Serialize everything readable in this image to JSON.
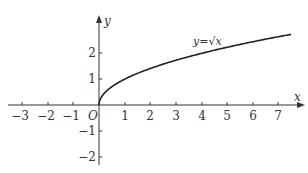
{
  "chart_data": {
    "type": "line",
    "title": "",
    "xlabel": "x",
    "ylabel": "y",
    "origin_label": "O",
    "xlim": [
      -3.5,
      7.9
    ],
    "ylim": [
      -2.3,
      3.4
    ],
    "grid": false,
    "x_ticks": [
      -3,
      -2,
      -1,
      1,
      2,
      3,
      4,
      5,
      6,
      7
    ],
    "x_tick_labels": [
      "−3",
      "−2",
      "−1",
      "1",
      "2",
      "3",
      "4",
      "5",
      "6",
      "7"
    ],
    "y_ticks": [
      -2,
      -1,
      1,
      2
    ],
    "y_tick_labels": [
      "−2",
      "−1",
      "1",
      "2"
    ],
    "series": [
      {
        "name": "y=√x",
        "function": "sqrt(x)",
        "domain": [
          0,
          7.5
        ],
        "x": [
          0,
          0.25,
          0.5,
          1,
          2,
          3,
          4,
          5,
          6,
          7,
          7.5
        ],
        "values": [
          0,
          0.5,
          0.71,
          1,
          1.41,
          1.73,
          2,
          2.24,
          2.45,
          2.65,
          2.74
        ]
      }
    ],
    "annotations": [
      {
        "text": "y=√x",
        "x": 4.3,
        "y": 2.4
      }
    ],
    "colors": {
      "axis": "#333333",
      "curve": "#222222"
    }
  },
  "labels": {
    "x_axis": "x",
    "y_axis": "y",
    "origin": "O",
    "curve": "y=√x",
    "x_ticks": [
      "−3",
      "−2",
      "−1",
      "1",
      "2",
      "3",
      "4",
      "5",
      "6",
      "7"
    ],
    "y_ticks": [
      "2",
      "1",
      "−1",
      "−2"
    ]
  }
}
